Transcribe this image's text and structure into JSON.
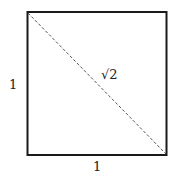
{
  "diagram": {
    "square": {
      "x": 27,
      "y": 12,
      "size": 139,
      "stroke": "#1a1a1a"
    },
    "diagonal": {
      "stroke": "#555555",
      "dashed": true
    },
    "labels": {
      "left_side": "1",
      "bottom_side": "1",
      "diagonal": "√2"
    }
  }
}
